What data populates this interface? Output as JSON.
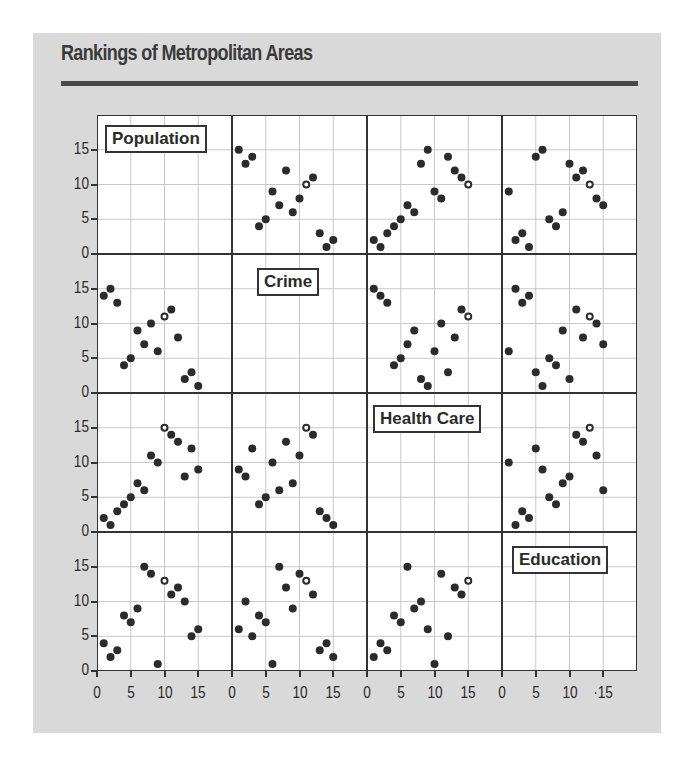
{
  "title": "Rankings of Metropolitan Areas",
  "variables": [
    "Population",
    "Crime",
    "Health Care",
    "Education"
  ],
  "axis": {
    "yticks": [
      "0",
      "5",
      "10",
      "15"
    ],
    "xticks": [
      "0",
      "5",
      "10",
      "15"
    ],
    "last_xticks": [
      "0",
      "5",
      "10",
      "·15"
    ]
  },
  "colors": {
    "background": "#d9d9d9",
    "panel": "#ffffff",
    "points": "#2b2b2b",
    "grid": "#c8c8c8",
    "frame": "#333333"
  },
  "chart_data": {
    "type": "scatter",
    "subtype": "scatter-plot-matrix",
    "title": "Rankings of Metropolitan Areas",
    "variables": [
      "Population",
      "Crime",
      "Health Care",
      "Education"
    ],
    "axis_range": [
      0,
      20
    ],
    "ticks": [
      0,
      5,
      10,
      15
    ],
    "grid": true,
    "highlighted_point": "one hollow point per panel",
    "panels": [
      {
        "row": 0,
        "col": 1,
        "x": "Crime",
        "y": "Population",
        "points": [
          [
            1,
            15
          ],
          [
            2,
            13
          ],
          [
            3,
            14
          ],
          [
            4,
            4
          ],
          [
            5,
            5
          ],
          [
            6,
            9
          ],
          [
            7,
            7
          ],
          [
            8,
            12
          ],
          [
            9,
            6
          ],
          [
            10,
            8
          ],
          [
            11,
            10,
            "hollow"
          ],
          [
            12,
            11
          ],
          [
            13,
            3
          ],
          [
            14,
            1
          ],
          [
            15,
            2
          ]
        ]
      },
      {
        "row": 0,
        "col": 2,
        "x": "Health Care",
        "y": "Population",
        "points": [
          [
            1,
            2
          ],
          [
            2,
            1
          ],
          [
            3,
            3
          ],
          [
            4,
            4
          ],
          [
            5,
            5
          ],
          [
            6,
            7
          ],
          [
            7,
            6
          ],
          [
            8,
            13
          ],
          [
            9,
            15
          ],
          [
            10,
            9
          ],
          [
            11,
            8
          ],
          [
            12,
            14
          ],
          [
            13,
            12
          ],
          [
            14,
            11
          ],
          [
            15,
            10,
            "hollow"
          ]
        ]
      },
      {
        "row": 0,
        "col": 3,
        "x": "Education",
        "y": "Population",
        "points": [
          [
            1,
            9
          ],
          [
            2,
            2
          ],
          [
            3,
            3
          ],
          [
            4,
            1
          ],
          [
            5,
            14
          ],
          [
            6,
            15
          ],
          [
            7,
            5
          ],
          [
            8,
            4
          ],
          [
            9,
            6
          ],
          [
            10,
            13
          ],
          [
            11,
            11
          ],
          [
            12,
            12
          ],
          [
            13,
            10,
            "hollow"
          ],
          [
            14,
            8
          ],
          [
            15,
            7
          ]
        ]
      },
      {
        "row": 1,
        "col": 0,
        "x": "Population",
        "y": "Crime",
        "points": [
          [
            1,
            14
          ],
          [
            2,
            15
          ],
          [
            3,
            13
          ],
          [
            4,
            4
          ],
          [
            5,
            5
          ],
          [
            6,
            9
          ],
          [
            7,
            7
          ],
          [
            8,
            10
          ],
          [
            9,
            6
          ],
          [
            10,
            11,
            "hollow"
          ],
          [
            11,
            12
          ],
          [
            12,
            8
          ],
          [
            13,
            2
          ],
          [
            14,
            3
          ],
          [
            15,
            1
          ]
        ]
      },
      {
        "row": 1,
        "col": 2,
        "x": "Health Care",
        "y": "Crime",
        "points": [
          [
            1,
            15
          ],
          [
            2,
            14
          ],
          [
            3,
            13
          ],
          [
            4,
            4
          ],
          [
            5,
            5
          ],
          [
            6,
            7
          ],
          [
            7,
            9
          ],
          [
            8,
            2
          ],
          [
            9,
            1
          ],
          [
            10,
            6
          ],
          [
            11,
            10
          ],
          [
            12,
            3
          ],
          [
            13,
            8
          ],
          [
            14,
            12
          ],
          [
            15,
            11,
            "hollow"
          ]
        ]
      },
      {
        "row": 1,
        "col": 3,
        "x": "Education",
        "y": "Crime",
        "points": [
          [
            1,
            6
          ],
          [
            2,
            15
          ],
          [
            3,
            13
          ],
          [
            4,
            14
          ],
          [
            5,
            3
          ],
          [
            6,
            1
          ],
          [
            7,
            5
          ],
          [
            8,
            4
          ],
          [
            9,
            9
          ],
          [
            10,
            2
          ],
          [
            11,
            12
          ],
          [
            12,
            8
          ],
          [
            13,
            11,
            "hollow"
          ],
          [
            14,
            10
          ],
          [
            15,
            7
          ]
        ]
      },
      {
        "row": 2,
        "col": 0,
        "x": "Population",
        "y": "Health Care",
        "points": [
          [
            1,
            2
          ],
          [
            2,
            1
          ],
          [
            3,
            3
          ],
          [
            4,
            4
          ],
          [
            5,
            5
          ],
          [
            6,
            7
          ],
          [
            7,
            6
          ],
          [
            8,
            11
          ],
          [
            9,
            10
          ],
          [
            10,
            15,
            "hollow"
          ],
          [
            11,
            14
          ],
          [
            12,
            13
          ],
          [
            13,
            8
          ],
          [
            14,
            12
          ],
          [
            15,
            9
          ]
        ]
      },
      {
        "row": 2,
        "col": 1,
        "x": "Crime",
        "y": "Health Care",
        "points": [
          [
            1,
            9
          ],
          [
            2,
            8
          ],
          [
            3,
            12
          ],
          [
            4,
            4
          ],
          [
            5,
            5
          ],
          [
            6,
            10
          ],
          [
            7,
            6
          ],
          [
            8,
            13
          ],
          [
            9,
            7
          ],
          [
            10,
            11
          ],
          [
            11,
            15,
            "hollow"
          ],
          [
            12,
            14
          ],
          [
            13,
            3
          ],
          [
            14,
            2
          ],
          [
            15,
            1
          ]
        ]
      },
      {
        "row": 2,
        "col": 3,
        "x": "Education",
        "y": "Health Care",
        "points": [
          [
            1,
            10
          ],
          [
            2,
            1
          ],
          [
            3,
            3
          ],
          [
            4,
            2
          ],
          [
            5,
            12
          ],
          [
            6,
            9
          ],
          [
            7,
            5
          ],
          [
            8,
            4
          ],
          [
            9,
            7
          ],
          [
            10,
            8
          ],
          [
            11,
            14
          ],
          [
            12,
            13
          ],
          [
            13,
            15,
            "hollow"
          ],
          [
            14,
            11
          ],
          [
            15,
            6
          ]
        ]
      },
      {
        "row": 3,
        "col": 0,
        "x": "Population",
        "y": "Education",
        "points": [
          [
            1,
            4
          ],
          [
            2,
            2
          ],
          [
            3,
            3
          ],
          [
            4,
            8
          ],
          [
            5,
            7
          ],
          [
            6,
            9
          ],
          [
            7,
            15
          ],
          [
            8,
            14
          ],
          [
            9,
            1
          ],
          [
            10,
            13,
            "hollow"
          ],
          [
            11,
            11
          ],
          [
            12,
            12
          ],
          [
            13,
            10
          ],
          [
            14,
            5
          ],
          [
            15,
            6
          ]
        ]
      },
      {
        "row": 3,
        "col": 1,
        "x": "Crime",
        "y": "Education",
        "points": [
          [
            1,
            6
          ],
          [
            2,
            10
          ],
          [
            3,
            5
          ],
          [
            4,
            8
          ],
          [
            5,
            7
          ],
          [
            6,
            1
          ],
          [
            7,
            15
          ],
          [
            8,
            12
          ],
          [
            9,
            9
          ],
          [
            10,
            14
          ],
          [
            11,
            13,
            "hollow"
          ],
          [
            12,
            11
          ],
          [
            13,
            3
          ],
          [
            14,
            4
          ],
          [
            15,
            2
          ]
        ]
      },
      {
        "row": 3,
        "col": 2,
        "x": "Health Care",
        "y": "Education",
        "points": [
          [
            1,
            2
          ],
          [
            2,
            4
          ],
          [
            3,
            3
          ],
          [
            4,
            8
          ],
          [
            5,
            7
          ],
          [
            6,
            15
          ],
          [
            7,
            9
          ],
          [
            8,
            10
          ],
          [
            9,
            6
          ],
          [
            10,
            1
          ],
          [
            11,
            14
          ],
          [
            12,
            5
          ],
          [
            13,
            12
          ],
          [
            14,
            11
          ],
          [
            15,
            13,
            "hollow"
          ]
        ]
      }
    ]
  }
}
